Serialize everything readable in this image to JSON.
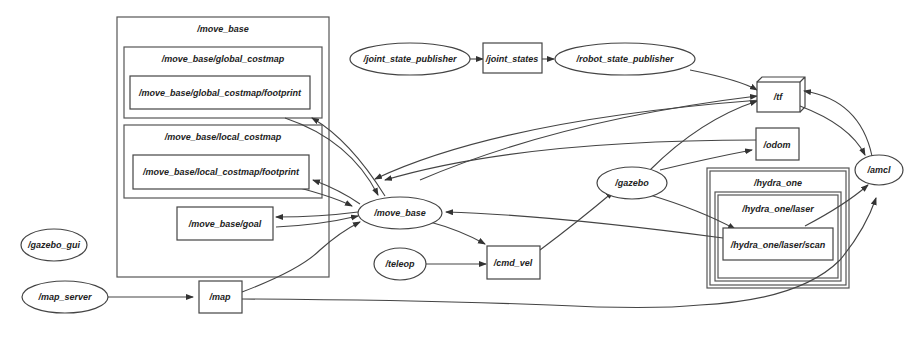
{
  "graph": {
    "type": "rqt_graph",
    "clusters": [
      {
        "id": "c_move_base",
        "label": "/move_base"
      },
      {
        "id": "c_global_costmap",
        "label": "/move_base/global_costmap"
      },
      {
        "id": "c_local_costmap",
        "label": "/move_base/local_costmap"
      },
      {
        "id": "c_hydra_one",
        "label": "/hydra_one"
      },
      {
        "id": "c_hydra_laser",
        "label": "/hydra_one/laser"
      }
    ],
    "nodes": [
      {
        "id": "global_footprint",
        "label": "/move_base/global_costmap/footprint",
        "shape": "box"
      },
      {
        "id": "local_footprint",
        "label": "/move_base/local_costmap/footprint",
        "shape": "box"
      },
      {
        "id": "goal",
        "label": "/move_base/goal",
        "shape": "box"
      },
      {
        "id": "joint_state_publisher",
        "label": "/joint_state_publisher",
        "shape": "ellipse"
      },
      {
        "id": "joint_states",
        "label": "/joint_states",
        "shape": "box"
      },
      {
        "id": "robot_state_publisher",
        "label": "/robot_state_publisher",
        "shape": "ellipse"
      },
      {
        "id": "tf",
        "label": "/tf",
        "shape": "box3d"
      },
      {
        "id": "odom",
        "label": "/odom",
        "shape": "box"
      },
      {
        "id": "amcl",
        "label": "/amcl",
        "shape": "ellipse"
      },
      {
        "id": "gazebo",
        "label": "/gazebo",
        "shape": "ellipse"
      },
      {
        "id": "move_base",
        "label": "/move_base",
        "shape": "ellipse"
      },
      {
        "id": "scan",
        "label": "/hydra_one/laser/scan",
        "shape": "box"
      },
      {
        "id": "gazebo_gui",
        "label": "/gazebo_gui",
        "shape": "ellipse"
      },
      {
        "id": "teleop",
        "label": "/teleop",
        "shape": "ellipse"
      },
      {
        "id": "cmd_vel",
        "label": "/cmd_vel",
        "shape": "box"
      },
      {
        "id": "map_server",
        "label": "/map_server",
        "shape": "ellipse"
      },
      {
        "id": "map",
        "label": "/map",
        "shape": "box"
      }
    ],
    "edges": [
      [
        "joint_state_publisher",
        "joint_states"
      ],
      [
        "joint_states",
        "robot_state_publisher"
      ],
      [
        "robot_state_publisher",
        "tf"
      ],
      [
        "move_base",
        "tf"
      ],
      [
        "gazebo",
        "tf"
      ],
      [
        "tf",
        "amcl"
      ],
      [
        "amcl",
        "tf"
      ],
      [
        "tf",
        "move_base"
      ],
      [
        "odom",
        "move_base"
      ],
      [
        "gazebo",
        "odom"
      ],
      [
        "gazebo",
        "scan"
      ],
      [
        "scan",
        "amcl"
      ],
      [
        "scan",
        "move_base"
      ],
      [
        "move_base",
        "global_footprint"
      ],
      [
        "global_footprint",
        "move_base"
      ],
      [
        "move_base",
        "local_footprint"
      ],
      [
        "local_footprint",
        "move_base"
      ],
      [
        "move_base",
        "goal"
      ],
      [
        "goal",
        "move_base"
      ],
      [
        "move_base",
        "cmd_vel"
      ],
      [
        "teleop",
        "cmd_vel"
      ],
      [
        "cmd_vel",
        "gazebo"
      ],
      [
        "map_server",
        "map"
      ],
      [
        "map",
        "move_base"
      ],
      [
        "map",
        "amcl"
      ]
    ]
  }
}
